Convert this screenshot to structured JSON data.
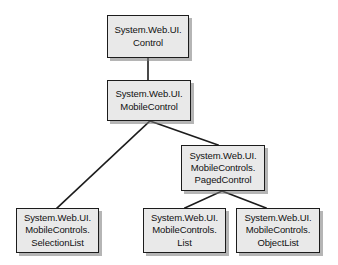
{
  "diagram": {
    "type": "class-hierarchy",
    "background_color": "#ffffff",
    "box_fill_color": "#e9e9e9",
    "box_border_color": "#1c1c1c",
    "edge_color": "#1c1c1c",
    "shadow_color": "#787878",
    "nodes": [
      {
        "id": "control",
        "lines": [
          "System.Web.UI.",
          "Control"
        ],
        "line1": "System.Web.UI.",
        "line2": "Control",
        "line3": ""
      },
      {
        "id": "mobilecontrol",
        "lines": [
          "System.Web.UI.",
          "MobileControl"
        ],
        "line1": "System.Web.UI.",
        "line2": "MobileControl",
        "line3": ""
      },
      {
        "id": "pagedcontrol",
        "lines": [
          "System.Web.UI.",
          "MobileControls.",
          "PagedControl"
        ],
        "line1": "System.Web.UI.",
        "line2": "MobileControls.",
        "line3": "PagedControl"
      },
      {
        "id": "selectionlist",
        "lines": [
          "System.Web.UI.",
          "MobileControls.",
          "SelectionList"
        ],
        "line1": "System.Web.UI.",
        "line2": "MobileControls.",
        "line3": "SelectionList"
      },
      {
        "id": "list",
        "lines": [
          "System.Web.UI.",
          "MobileControls.",
          "List"
        ],
        "line1": "System.Web.UI.",
        "line2": "MobileControls.",
        "line3": "List"
      },
      {
        "id": "objectlist",
        "lines": [
          "System.Web.UI.",
          "MobileControls.",
          "ObjectList"
        ],
        "line1": "System.Web.UI.",
        "line2": "MobileControls.",
        "line3": "ObjectList"
      }
    ],
    "edges": [
      {
        "id": "control-to-mobilecontrol",
        "from": "control",
        "to": "mobilecontrol"
      },
      {
        "id": "mobilecontrol-to-selectionlist",
        "from": "mobilecontrol",
        "to": "selectionlist"
      },
      {
        "id": "mobilecontrol-to-pagedcontrol",
        "from": "mobilecontrol",
        "to": "pagedcontrol"
      },
      {
        "id": "pagedcontrol-to-list",
        "from": "pagedcontrol",
        "to": "list"
      },
      {
        "id": "pagedcontrol-to-objectlist",
        "from": "pagedcontrol",
        "to": "objectlist"
      }
    ]
  }
}
